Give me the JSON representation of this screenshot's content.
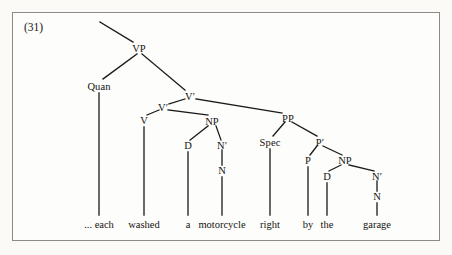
{
  "figure": {
    "example_number": "(31)",
    "border_color": "#8a8a8a",
    "background_color": "#fdfdfb",
    "line_color": "#1a1a1a"
  },
  "tree": {
    "nodes": [
      {
        "id": "vp",
        "label": "VP",
        "x": 139,
        "y": 48
      },
      {
        "id": "quan",
        "label": "Quan",
        "x": 99,
        "y": 86
      },
      {
        "id": "vbar_top",
        "label": "V′",
        "x": 190,
        "y": 96
      },
      {
        "id": "vbar_low",
        "label": "V′",
        "x": 163,
        "y": 107
      },
      {
        "id": "v",
        "label": "V",
        "x": 144,
        "y": 120
      },
      {
        "id": "np_obj",
        "label": "NP",
        "x": 212,
        "y": 121
      },
      {
        "id": "d_obj",
        "label": "D",
        "x": 188,
        "y": 145
      },
      {
        "id": "nbar_obj",
        "label": "N′",
        "x": 222,
        "y": 145
      },
      {
        "id": "n_obj",
        "label": "N",
        "x": 222,
        "y": 170
      },
      {
        "id": "pp",
        "label": "PP",
        "x": 288,
        "y": 118
      },
      {
        "id": "spec",
        "label": "Spec",
        "x": 270,
        "y": 142
      },
      {
        "id": "pbar",
        "label": "P′",
        "x": 320,
        "y": 142
      },
      {
        "id": "p",
        "label": "P",
        "x": 308,
        "y": 160
      },
      {
        "id": "np_pp",
        "label": "NP",
        "x": 345,
        "y": 160
      },
      {
        "id": "d_pp",
        "label": "D",
        "x": 327,
        "y": 176
      },
      {
        "id": "nbar_pp",
        "label": "N′",
        "x": 377,
        "y": 176
      },
      {
        "id": "n_pp",
        "label": "N",
        "x": 377,
        "y": 196
      }
    ],
    "edges": [
      {
        "from": "root-stub",
        "x1": 100,
        "y1": 22,
        "x2": 133,
        "y2": 42
      },
      {
        "from": "vp-quan",
        "x1": 137,
        "y1": 54,
        "x2": 103,
        "y2": 79
      },
      {
        "from": "vp-vbar",
        "x1": 142,
        "y1": 54,
        "x2": 185,
        "y2": 90
      },
      {
        "from": "vbar-vbarlow",
        "x1": 185,
        "y1": 99,
        "x2": 169,
        "y2": 104
      },
      {
        "from": "vbar-pp",
        "x1": 196,
        "y1": 99,
        "x2": 282,
        "y2": 113
      },
      {
        "from": "vbarlow-v",
        "x1": 159,
        "y1": 110,
        "x2": 147,
        "y2": 115
      },
      {
        "from": "vbarlow-np",
        "x1": 168,
        "y1": 110,
        "x2": 208,
        "y2": 115
      },
      {
        "from": "np-d",
        "x1": 208,
        "y1": 126,
        "x2": 190,
        "y2": 140
      },
      {
        "from": "np-nbar",
        "x1": 216,
        "y1": 126,
        "x2": 221,
        "y2": 140
      },
      {
        "from": "nbar-n",
        "x1": 222,
        "y1": 150,
        "x2": 222,
        "y2": 165
      },
      {
        "from": "pp-spec",
        "x1": 285,
        "y1": 122,
        "x2": 273,
        "y2": 136
      },
      {
        "from": "pp-pbar",
        "x1": 292,
        "y1": 122,
        "x2": 317,
        "y2": 136
      },
      {
        "from": "pbar-p",
        "x1": 317,
        "y1": 146,
        "x2": 310,
        "y2": 155
      },
      {
        "from": "pbar-np",
        "x1": 323,
        "y1": 146,
        "x2": 342,
        "y2": 155
      },
      {
        "from": "nppp-d",
        "x1": 341,
        "y1": 165,
        "x2": 329,
        "y2": 171
      },
      {
        "from": "nppp-nbar",
        "x1": 349,
        "y1": 165,
        "x2": 374,
        "y2": 171
      },
      {
        "from": "nbarpp-n",
        "x1": 377,
        "y1": 181,
        "x2": 377,
        "y2": 191
      },
      {
        "from": "quan-each",
        "x1": 99,
        "y1": 93,
        "x2": 99,
        "y2": 215
      },
      {
        "from": "v-washed",
        "x1": 144,
        "y1": 127,
        "x2": 144,
        "y2": 215
      },
      {
        "from": "d-a",
        "x1": 188,
        "y1": 152,
        "x2": 188,
        "y2": 215
      },
      {
        "from": "n-motorcycle",
        "x1": 222,
        "y1": 177,
        "x2": 222,
        "y2": 215
      },
      {
        "from": "spec-right",
        "x1": 270,
        "y1": 149,
        "x2": 270,
        "y2": 215
      },
      {
        "from": "p-by",
        "x1": 308,
        "y1": 167,
        "x2": 308,
        "y2": 215
      },
      {
        "from": "dpp-the",
        "x1": 327,
        "y1": 183,
        "x2": 327,
        "y2": 215
      },
      {
        "from": "npp-garage",
        "x1": 377,
        "y1": 203,
        "x2": 377,
        "y2": 215
      }
    ],
    "words": [
      {
        "id": "each",
        "label": "... each",
        "x": 99,
        "y": 224
      },
      {
        "id": "washed",
        "label": "washed",
        "x": 144,
        "y": 224
      },
      {
        "id": "a",
        "label": "a",
        "x": 188,
        "y": 224
      },
      {
        "id": "motorcycle",
        "label": "motorcycle",
        "x": 222,
        "y": 224
      },
      {
        "id": "right",
        "label": "right",
        "x": 270,
        "y": 224
      },
      {
        "id": "by",
        "label": "by",
        "x": 308,
        "y": 224
      },
      {
        "id": "the",
        "label": "the",
        "x": 327,
        "y": 224
      },
      {
        "id": "garage",
        "label": "garage",
        "x": 377,
        "y": 224
      }
    ]
  }
}
